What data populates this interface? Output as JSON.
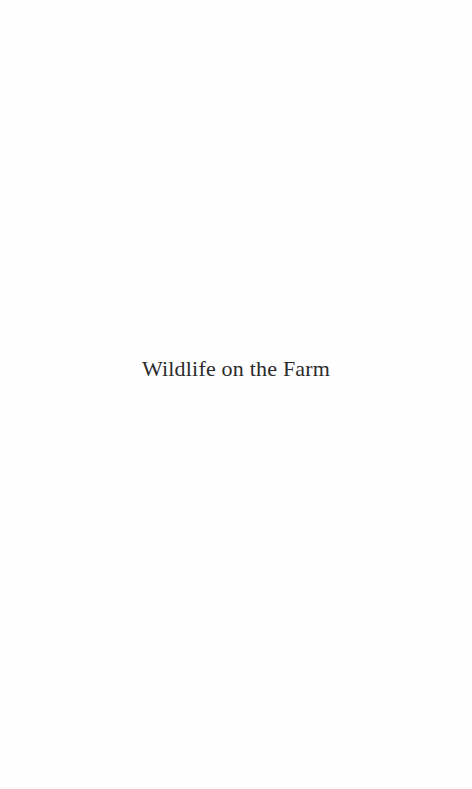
{
  "page": {
    "type": "half-title",
    "title": "Wildlife on the Farm"
  }
}
